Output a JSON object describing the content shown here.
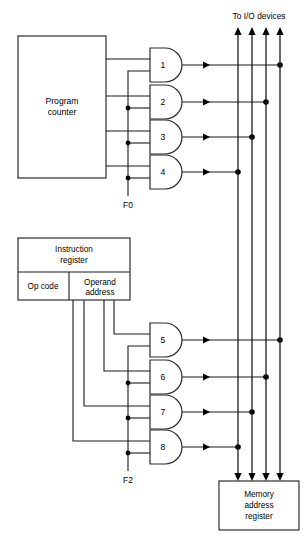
{
  "diagram": {
    "title_top": "To I/O devices",
    "blocks": [
      {
        "id": "program-counter",
        "label": "Program\ncounter",
        "line1": "Program",
        "line2": "counter"
      },
      {
        "id": "instruction-register",
        "label": "Instruction register",
        "line1": "Instruction",
        "line2": "register"
      },
      {
        "id": "op-code-field",
        "label": "Op code"
      },
      {
        "id": "operand-address-field",
        "line1": "Operand",
        "line2": "address"
      },
      {
        "id": "memory-address-register",
        "line1": "Memory",
        "line2": "address",
        "line3": "register"
      }
    ],
    "gates": [
      {
        "id": "gate-1",
        "label": "1",
        "source": "program-counter",
        "bus": 4
      },
      {
        "id": "gate-2",
        "label": "2",
        "source": "program-counter",
        "bus": 3
      },
      {
        "id": "gate-3",
        "label": "3",
        "source": "program-counter",
        "bus": 2
      },
      {
        "id": "gate-4",
        "label": "4",
        "source": "program-counter",
        "bus": 1
      },
      {
        "id": "gate-5",
        "label": "5",
        "source": "operand-address-field",
        "bus": 4
      },
      {
        "id": "gate-6",
        "label": "6",
        "source": "operand-address-field",
        "bus": 3
      },
      {
        "id": "gate-7",
        "label": "7",
        "source": "operand-address-field",
        "bus": 2
      },
      {
        "id": "gate-8",
        "label": "8",
        "source": "operand-address-field",
        "bus": 1
      }
    ],
    "control_signals": [
      {
        "id": "signal-f0",
        "label": "F0",
        "gates": [
          "1",
          "2",
          "3",
          "4"
        ]
      },
      {
        "id": "signal-f2",
        "label": "F2",
        "gates": [
          "5",
          "6",
          "7",
          "8"
        ]
      }
    ],
    "bus_count": 4,
    "colors": {
      "line": "#1a1a1a",
      "background": "#ffffff",
      "text": "#000000"
    }
  }
}
